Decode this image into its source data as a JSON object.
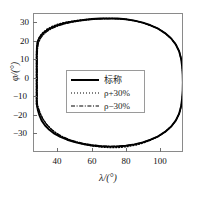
{
  "chart_data": {
    "type": "line",
    "title": "",
    "xlabel": "λ/(°)",
    "ylabel": "φ/(°)",
    "xlim": [
      26,
      113
    ],
    "ylim": [
      -39.5,
      39.5
    ],
    "xticks": [
      40,
      60,
      80,
      100
    ],
    "yticks": [
      30,
      20,
      10,
      0,
      -10,
      -20,
      -30
    ],
    "xtick_labels": [
      "40",
      "60",
      "80",
      "100"
    ],
    "ytick_labels": [
      "30",
      "20",
      "10",
      "0",
      "-10",
      "-20",
      "-30"
    ],
    "grid": false,
    "legend_position": "center-left",
    "series": [
      {
        "name": "标称",
        "style": "solid",
        "color": "#000000",
        "points": [
          [
            27.6,
            12.0
          ],
          [
            27.6,
            16.0
          ],
          [
            27.7,
            20.0
          ],
          [
            28.0,
            23.0
          ],
          [
            29.0,
            25.5
          ],
          [
            30.5,
            27.6
          ],
          [
            32.5,
            29.4
          ],
          [
            35.0,
            31.0
          ],
          [
            38.0,
            32.4
          ],
          [
            41.5,
            33.6
          ],
          [
            45.5,
            34.6
          ],
          [
            50.0,
            35.4
          ],
          [
            55.0,
            36.1
          ],
          [
            60.0,
            36.6
          ],
          [
            65.0,
            36.9
          ],
          [
            70.0,
            37.0
          ],
          [
            75.0,
            36.9
          ],
          [
            80.0,
            36.5
          ],
          [
            85.0,
            35.7
          ],
          [
            90.0,
            34.5
          ],
          [
            94.5,
            33.0
          ],
          [
            99.0,
            31.0
          ],
          [
            103.0,
            28.5
          ],
          [
            106.5,
            25.5
          ],
          [
            109.3,
            22.0
          ],
          [
            111.3,
            18.0
          ],
          [
            112.5,
            13.5
          ],
          [
            113.1,
            9.0
          ],
          [
            113.4,
            4.5
          ],
          [
            113.5,
            0.0
          ],
          [
            113.4,
            -4.5
          ],
          [
            113.1,
            -9.0
          ],
          [
            112.5,
            -13.5
          ],
          [
            111.3,
            -18.0
          ],
          [
            109.3,
            -22.0
          ],
          [
            106.5,
            -25.5
          ],
          [
            103.0,
            -28.5
          ],
          [
            99.0,
            -31.0
          ],
          [
            94.5,
            -33.0
          ],
          [
            90.0,
            -34.5
          ],
          [
            85.0,
            -35.7
          ],
          [
            80.0,
            -36.5
          ],
          [
            75.0,
            -36.9
          ],
          [
            70.0,
            -37.0
          ],
          [
            65.0,
            -36.8
          ],
          [
            60.0,
            -36.3
          ],
          [
            55.0,
            -35.5
          ],
          [
            50.0,
            -34.4
          ],
          [
            45.5,
            -33.0
          ],
          [
            41.5,
            -31.4
          ],
          [
            38.0,
            -29.5
          ],
          [
            35.0,
            -27.3
          ],
          [
            32.5,
            -24.8
          ],
          [
            30.5,
            -22.0
          ],
          [
            29.2,
            -19.0
          ],
          [
            28.3,
            -16.0
          ],
          [
            27.8,
            -13.5
          ],
          [
            27.6,
            -12.0
          ]
        ]
      },
      {
        "name": "ρ+30%",
        "style": "dotted",
        "color": "#000000",
        "points": [
          [
            27.4,
            12.5
          ],
          [
            27.4,
            16.5
          ],
          [
            27.6,
            20.5
          ],
          [
            28.2,
            24.0
          ],
          [
            29.4,
            26.6
          ],
          [
            31.2,
            28.8
          ],
          [
            33.4,
            30.6
          ],
          [
            36.0,
            32.1
          ],
          [
            39.0,
            33.3
          ],
          [
            42.5,
            34.3
          ],
          [
            46.5,
            35.1
          ],
          [
            51.0,
            35.8
          ],
          [
            56.0,
            36.3
          ],
          [
            61.0,
            36.7
          ],
          [
            66.0,
            36.9
          ],
          [
            71.0,
            37.0
          ],
          [
            76.0,
            36.8
          ],
          [
            81.0,
            36.3
          ],
          [
            86.0,
            35.4
          ],
          [
            90.5,
            34.2
          ],
          [
            95.0,
            32.7
          ],
          [
            99.5,
            30.7
          ],
          [
            103.3,
            28.2
          ],
          [
            106.8,
            25.2
          ],
          [
            109.5,
            21.7
          ],
          [
            111.4,
            17.7
          ],
          [
            112.6,
            13.2
          ],
          [
            113.2,
            8.8
          ],
          [
            113.5,
            4.4
          ],
          [
            113.6,
            0.0
          ],
          [
            113.5,
            -4.4
          ],
          [
            113.2,
            -8.8
          ],
          [
            112.6,
            -13.2
          ],
          [
            111.4,
            -17.7
          ],
          [
            109.5,
            -21.7
          ],
          [
            106.8,
            -25.2
          ],
          [
            103.3,
            -28.2
          ],
          [
            99.5,
            -30.9
          ],
          [
            95.0,
            -33.1
          ],
          [
            90.5,
            -34.8
          ],
          [
            86.0,
            -36.1
          ],
          [
            81.0,
            -37.0
          ],
          [
            76.0,
            -37.5
          ],
          [
            71.0,
            -37.6
          ],
          [
            66.0,
            -37.3
          ],
          [
            61.0,
            -36.7
          ],
          [
            56.0,
            -35.8
          ],
          [
            51.0,
            -34.6
          ],
          [
            46.5,
            -33.1
          ],
          [
            42.5,
            -31.3
          ],
          [
            39.0,
            -29.2
          ],
          [
            36.0,
            -26.8
          ],
          [
            33.4,
            -24.0
          ],
          [
            31.2,
            -21.0
          ],
          [
            29.6,
            -18.0
          ],
          [
            28.4,
            -15.5
          ],
          [
            27.8,
            -13.8
          ],
          [
            27.4,
            -12.5
          ]
        ]
      },
      {
        "name": "ρ-30%",
        "style": "dashdot",
        "color": "#000000",
        "points": [
          [
            27.9,
            11.5
          ],
          [
            27.9,
            15.5
          ],
          [
            28.1,
            19.5
          ],
          [
            28.6,
            22.8
          ],
          [
            29.8,
            25.4
          ],
          [
            31.4,
            27.5
          ],
          [
            33.4,
            29.3
          ],
          [
            36.0,
            30.9
          ],
          [
            39.0,
            32.2
          ],
          [
            42.5,
            33.4
          ],
          [
            46.5,
            34.4
          ],
          [
            51.0,
            35.2
          ],
          [
            56.0,
            35.9
          ],
          [
            61.0,
            36.4
          ],
          [
            66.0,
            36.7
          ],
          [
            71.0,
            36.8
          ],
          [
            76.0,
            36.7
          ],
          [
            81.0,
            36.3
          ],
          [
            86.0,
            35.5
          ],
          [
            90.5,
            34.3
          ],
          [
            95.0,
            32.8
          ],
          [
            99.5,
            30.8
          ],
          [
            103.3,
            28.3
          ],
          [
            106.8,
            25.3
          ],
          [
            109.5,
            21.8
          ],
          [
            111.4,
            17.8
          ],
          [
            112.6,
            13.3
          ],
          [
            113.2,
            8.9
          ],
          [
            113.5,
            4.4
          ],
          [
            113.6,
            0.0
          ],
          [
            113.5,
            -4.4
          ],
          [
            113.2,
            -8.9
          ],
          [
            112.6,
            -13.3
          ],
          [
            111.4,
            -17.8
          ],
          [
            109.5,
            -21.8
          ],
          [
            106.8,
            -25.3
          ],
          [
            103.3,
            -28.3
          ],
          [
            99.5,
            -30.8
          ],
          [
            95.0,
            -32.8
          ],
          [
            90.5,
            -34.3
          ],
          [
            86.0,
            -35.5
          ],
          [
            81.0,
            -36.3
          ],
          [
            76.0,
            -36.7
          ],
          [
            71.0,
            -36.8
          ],
          [
            66.0,
            -36.6
          ],
          [
            61.0,
            -36.1
          ],
          [
            56.0,
            -35.3
          ],
          [
            51.0,
            -34.2
          ],
          [
            46.5,
            -32.8
          ],
          [
            42.5,
            -31.1
          ],
          [
            39.0,
            -29.1
          ],
          [
            36.0,
            -26.8
          ],
          [
            33.4,
            -24.2
          ],
          [
            31.4,
            -21.4
          ],
          [
            30.0,
            -18.4
          ],
          [
            28.9,
            -15.6
          ],
          [
            28.2,
            -13.2
          ],
          [
            27.9,
            -11.5
          ]
        ]
      }
    ]
  },
  "legend": {
    "items": [
      {
        "label": "标称",
        "style": "solid"
      },
      {
        "label": "ρ+30%",
        "style": "dotted"
      },
      {
        "label": "ρ−30%",
        "style": "dashdot"
      }
    ]
  },
  "axes": {
    "xlabel": "λ/(°)",
    "ylabel": "φ/(°)",
    "xtick_labels": [
      "40",
      "60",
      "80",
      "100"
    ],
    "ytick_labels": [
      "30",
      "20",
      "10",
      "0",
      "−10",
      "−20",
      "−30"
    ]
  }
}
